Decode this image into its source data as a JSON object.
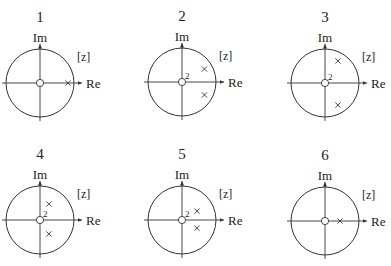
{
  "figure": {
    "axis_labels": {
      "real": "Re",
      "imag": "Im"
    },
    "plane_label": "[z]",
    "unit_circle_radius_px": 34,
    "colors": {
      "stroke": "#333333",
      "text": "#222222",
      "background": "#ffffff"
    },
    "panels": [
      {
        "id": "1",
        "title": "1",
        "center": [
          40,
          83
        ],
        "zeros": [
          {
            "x": 0,
            "y": 0,
            "multiplicity": 1,
            "label": ""
          }
        ],
        "poles": [
          {
            "x": 0.82,
            "y": 0
          }
        ]
      },
      {
        "id": "2",
        "title": "2",
        "center": [
          182,
          82
        ],
        "zeros": [
          {
            "x": 0,
            "y": 0,
            "multiplicity": 2,
            "label": "2"
          }
        ],
        "poles": [
          {
            "x": 0.66,
            "y": 0.38
          },
          {
            "x": 0.66,
            "y": -0.38
          }
        ]
      },
      {
        "id": "3",
        "title": "3",
        "center": [
          325,
          83
        ],
        "zeros": [
          {
            "x": 0,
            "y": 0,
            "multiplicity": 2,
            "label": "2"
          }
        ],
        "poles": [
          {
            "x": 0.38,
            "y": 0.65
          },
          {
            "x": 0.38,
            "y": -0.65
          }
        ]
      },
      {
        "id": "4",
        "title": "4",
        "center": [
          40,
          220
        ],
        "zeros": [
          {
            "x": 0,
            "y": 0,
            "multiplicity": 2,
            "label": "2"
          }
        ],
        "poles": [
          {
            "x": 0.26,
            "y": 0.47
          },
          {
            "x": 0.26,
            "y": -0.41
          }
        ]
      },
      {
        "id": "5",
        "title": "5",
        "center": [
          182,
          220
        ],
        "zeros": [
          {
            "x": 0,
            "y": 0,
            "multiplicity": 2,
            "label": "2"
          }
        ],
        "poles": [
          {
            "x": 0.44,
            "y": 0.26
          },
          {
            "x": 0.44,
            "y": -0.24
          }
        ]
      },
      {
        "id": "6",
        "title": "6",
        "center": [
          325,
          221
        ],
        "zeros": [
          {
            "x": 0,
            "y": 0,
            "multiplicity": 1,
            "label": ""
          }
        ],
        "poles": [
          {
            "x": 0.44,
            "y": 0
          }
        ]
      }
    ]
  }
}
